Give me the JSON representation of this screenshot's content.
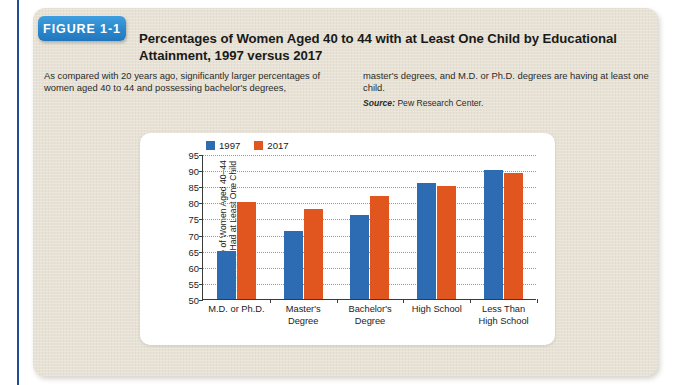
{
  "figure": {
    "badge_label": "FIGURE 1-1",
    "title": "Percentages of Women Aged 40 to 44 with at Least One Child by Educational Attainment, 1997 versus 2017",
    "caption_left": "As compared with 20 years ago, significantly larger percentages of women aged 40 to 44 and possessing bachelor's degrees,",
    "caption_right": "master's degrees, and M.D. or Ph.D. degrees are having at least one child.",
    "source_label": "Source:",
    "source_text": " Pew Research Center."
  },
  "colors": {
    "badge_blue": "#2b87cc",
    "spine_blue": "#1f4e94",
    "panel_beige": "#e7e2d5",
    "series_1997": "#2d6cb2",
    "series_2017": "#e1551f"
  },
  "chart_data": {
    "type": "bar",
    "title": "",
    "xlabel": "",
    "ylabel": "Percentage of Women Aged 40–44 Who Have Had at Least One Child (percent)",
    "ylim": [
      50,
      95
    ],
    "yticks": [
      50,
      55,
      60,
      65,
      70,
      75,
      80,
      85,
      90,
      95
    ],
    "grid": true,
    "legend_position": "top-left",
    "categories": [
      "M.D. or Ph.D.",
      "Master's Degree",
      "Bachelor's Degree",
      "High School",
      "Less Than High School"
    ],
    "category_lines": [
      [
        "M.D. or Ph.D."
      ],
      [
        "Master's",
        "Degree"
      ],
      [
        "Bachelor's",
        "Degree"
      ],
      [
        "High School"
      ],
      [
        "Less Than",
        "High School"
      ]
    ],
    "series": [
      {
        "name": "1997",
        "color": "#2d6cb2",
        "values": [
          65,
          71,
          76,
          86,
          90
        ]
      },
      {
        "name": "2017",
        "color": "#e1551f",
        "values": [
          80,
          78,
          82,
          85,
          89
        ]
      }
    ]
  }
}
